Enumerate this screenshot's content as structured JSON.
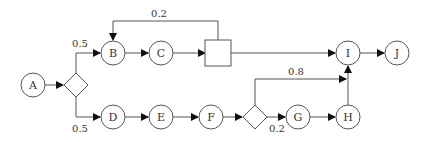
{
  "diagram": {
    "type": "process-flow",
    "nodes": [
      {
        "id": "A",
        "label": "A",
        "shape": "circle"
      },
      {
        "id": "split1",
        "label": "",
        "shape": "diamond"
      },
      {
        "id": "B",
        "label": "B",
        "shape": "circle"
      },
      {
        "id": "C",
        "label": "C",
        "shape": "circle"
      },
      {
        "id": "box",
        "label": "",
        "shape": "square"
      },
      {
        "id": "I",
        "label": "I",
        "shape": "circle"
      },
      {
        "id": "J",
        "label": "J",
        "shape": "circle"
      },
      {
        "id": "D",
        "label": "D",
        "shape": "circle"
      },
      {
        "id": "E",
        "label": "E",
        "shape": "circle"
      },
      {
        "id": "F",
        "label": "F",
        "shape": "circle"
      },
      {
        "id": "split2",
        "label": "",
        "shape": "diamond"
      },
      {
        "id": "G",
        "label": "G",
        "shape": "circle"
      },
      {
        "id": "H",
        "label": "H",
        "shape": "circle"
      }
    ],
    "edges": [
      {
        "from": "A",
        "to": "split1",
        "label": ""
      },
      {
        "from": "split1",
        "to": "B",
        "label": "0.5"
      },
      {
        "from": "split1",
        "to": "D",
        "label": "0.5"
      },
      {
        "from": "B",
        "to": "C",
        "label": ""
      },
      {
        "from": "C",
        "to": "box",
        "label": ""
      },
      {
        "from": "box",
        "to": "B",
        "label": "0.2"
      },
      {
        "from": "box",
        "to": "I",
        "label": ""
      },
      {
        "from": "I",
        "to": "J",
        "label": ""
      },
      {
        "from": "D",
        "to": "E",
        "label": ""
      },
      {
        "from": "E",
        "to": "F",
        "label": ""
      },
      {
        "from": "F",
        "to": "split2",
        "label": ""
      },
      {
        "from": "split2",
        "to": "I",
        "label": "0.8"
      },
      {
        "from": "split2",
        "to": "G",
        "label": "0.2"
      },
      {
        "from": "G",
        "to": "H",
        "label": ""
      },
      {
        "from": "H",
        "to": "I",
        "label": ""
      }
    ],
    "labels": {
      "A": "A",
      "B": "B",
      "C": "C",
      "D": "D",
      "E": "E",
      "F": "F",
      "G": "G",
      "H": "H",
      "I": "I",
      "J": "J",
      "split1_to_B": "0.5",
      "split1_to_D": "0.5",
      "box_feedback": "0.2",
      "split2_to_I": "0.8",
      "split2_to_G": "0.2"
    }
  }
}
